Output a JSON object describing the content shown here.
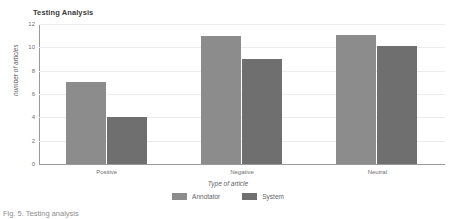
{
  "chart_data": {
    "type": "bar",
    "title": "Testing Analysis",
    "xlabel": "Type of article",
    "ylabel": "number of articles",
    "categories": [
      "Positive",
      "Negative",
      "Neutral"
    ],
    "series": [
      {
        "name": "Annotator",
        "color": "#8c8c8c",
        "values": [
          7,
          11,
          11.1
        ]
      },
      {
        "name": "System",
        "color": "#6f6f6f",
        "values": [
          4,
          9,
          10.1
        ]
      }
    ],
    "ylim": [
      0,
      12
    ],
    "yticks": [
      0,
      2,
      4,
      6,
      8,
      10,
      12
    ],
    "ytick_labels": [
      "0",
      "2",
      "4",
      "6",
      "8",
      "10",
      "12"
    ],
    "grid": true,
    "legend_position": "bottom"
  },
  "caption": {
    "text": "Fig. 5. Testing analysis"
  }
}
